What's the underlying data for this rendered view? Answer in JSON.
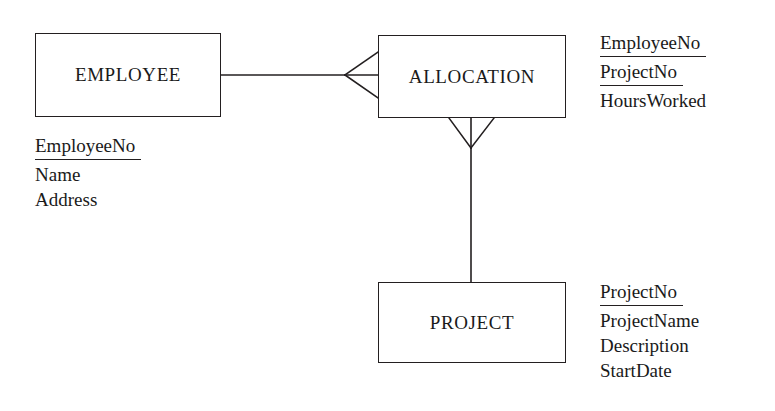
{
  "diagram": {
    "type": "entity-relationship-diagram",
    "notation": "crows-foot",
    "background_color": "#ffffff",
    "line_color": "#231f20",
    "text_color": "#1a1a1a",
    "entities": [
      {
        "id": "employee",
        "name": "EMPLOYEE",
        "attributes": [
          {
            "name": "EmployeeNo",
            "key": true
          },
          {
            "name": "Name",
            "key": false
          },
          {
            "name": "Address",
            "key": false
          }
        ]
      },
      {
        "id": "allocation",
        "name": "ALLOCATION",
        "attributes": [
          {
            "name": "EmployeeNo",
            "key": true
          },
          {
            "name": "ProjectNo",
            "key": true
          },
          {
            "name": "HoursWorked",
            "key": false
          }
        ]
      },
      {
        "id": "project",
        "name": "PROJECT",
        "attributes": [
          {
            "name": "ProjectNo",
            "key": true
          },
          {
            "name": "ProjectName",
            "key": false
          },
          {
            "name": "Description",
            "key": false
          },
          {
            "name": "StartDate",
            "key": false
          }
        ]
      }
    ],
    "relationships": [
      {
        "id": "employee-allocation",
        "from": "EMPLOYEE",
        "to": "ALLOCATION",
        "from_cardinality": "one",
        "to_cardinality": "many",
        "orientation": "horizontal"
      },
      {
        "id": "allocation-project",
        "from": "ALLOCATION",
        "to": "PROJECT",
        "from_cardinality": "many",
        "to_cardinality": "one",
        "orientation": "vertical"
      }
    ]
  }
}
